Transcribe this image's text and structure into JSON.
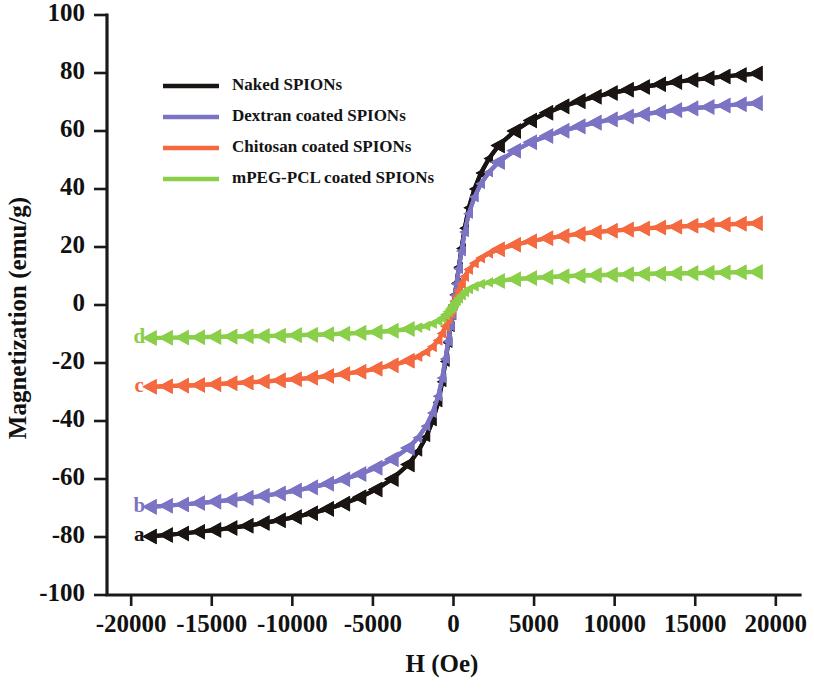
{
  "chart_data": {
    "type": "line",
    "title": "",
    "xlabel": "H (Oe)",
    "ylabel": "Magnetization (emu/g)",
    "xlim": [
      -21500,
      21500
    ],
    "ylim": [
      -100,
      100
    ],
    "xticks": [
      -20000,
      -15000,
      -10000,
      -5000,
      0,
      5000,
      10000,
      15000,
      20000
    ],
    "xticklabels": [
      "-20000",
      "-15000",
      "-10000",
      "-5000",
      "0",
      "5000",
      "10000",
      "15000",
      "20000"
    ],
    "yticks": [
      -100,
      -80,
      -60,
      -40,
      -20,
      0,
      20,
      40,
      60,
      80,
      100
    ],
    "yticklabels": [
      "-100",
      "-80",
      "-60",
      "-40",
      "-20",
      "0",
      "20",
      "40",
      "60",
      "80",
      "100"
    ],
    "grid": false,
    "marker": "left-triangle",
    "legend_position": "upper-left-inside",
    "x": [
      -18800,
      -17800,
      -16800,
      -15800,
      -14800,
      -13800,
      -12800,
      -11800,
      -10800,
      -9800,
      -8800,
      -7800,
      -6800,
      -5800,
      -4800,
      -3800,
      -2800,
      -2200,
      -1700,
      -1300,
      -950,
      -700,
      -500,
      -330,
      -190,
      -90,
      0,
      90,
      190,
      330,
      500,
      700,
      950,
      1300,
      1700,
      2200,
      2800,
      3800,
      4800,
      5800,
      6800,
      7800,
      8800,
      9800,
      10800,
      11800,
      12800,
      13800,
      14800,
      15800,
      16800,
      17800,
      18800
    ],
    "series": [
      {
        "name": "Naked SPIONs",
        "tag": "a",
        "color": "#1a1412",
        "saturation_positive": 79.5,
        "saturation_negative": -79.5,
        "values": [
          -79.8,
          -79.3,
          -78.8,
          -78.2,
          -77.6,
          -76.9,
          -76.1,
          -75.2,
          -74.2,
          -73.1,
          -71.8,
          -70.3,
          -68.5,
          -66.3,
          -63.6,
          -60.0,
          -55.0,
          -50.5,
          -45.5,
          -40.0,
          -33.5,
          -26.5,
          -19.5,
          -13.0,
          -7.5,
          -3.5,
          0.0,
          3.5,
          7.5,
          13.0,
          19.5,
          26.5,
          33.5,
          40.0,
          45.5,
          50.5,
          55.0,
          60.0,
          63.6,
          66.3,
          68.5,
          70.3,
          71.8,
          73.1,
          74.2,
          75.2,
          76.1,
          76.9,
          77.6,
          78.2,
          78.8,
          79.3,
          79.8
        ]
      },
      {
        "name": "Dextran coated SPIONs",
        "tag": "b",
        "color": "#7b74c4",
        "saturation_positive": 69.5,
        "saturation_negative": -69.5,
        "values": [
          -69.6,
          -69.2,
          -68.8,
          -68.3,
          -67.8,
          -67.2,
          -66.5,
          -65.8,
          -65.0,
          -64.0,
          -62.9,
          -61.6,
          -60.1,
          -58.3,
          -56.1,
          -53.2,
          -49.3,
          -45.8,
          -41.8,
          -37.2,
          -31.5,
          -25.2,
          -18.6,
          -12.5,
          -7.2,
          -3.4,
          0.0,
          3.4,
          7.2,
          12.5,
          18.6,
          25.2,
          31.5,
          37.2,
          41.8,
          45.8,
          49.3,
          53.2,
          56.1,
          58.3,
          60.1,
          61.6,
          62.9,
          64.0,
          65.0,
          65.8,
          66.5,
          67.2,
          67.8,
          68.3,
          68.8,
          69.2,
          69.6
        ]
      },
      {
        "name": "Chitosan coated SPIONs",
        "tag": "c",
        "color": "#f4693f",
        "saturation_positive": 28.0,
        "saturation_negative": -28.0,
        "values": [
          -28.2,
          -28.0,
          -27.8,
          -27.6,
          -27.3,
          -27.0,
          -26.7,
          -26.4,
          -26.0,
          -25.6,
          -25.1,
          -24.5,
          -23.8,
          -23.0,
          -22.0,
          -20.8,
          -19.2,
          -17.8,
          -16.2,
          -14.4,
          -12.2,
          -9.8,
          -7.3,
          -4.9,
          -2.9,
          -1.4,
          0.0,
          1.4,
          2.9,
          4.9,
          7.3,
          9.8,
          12.2,
          14.4,
          16.2,
          17.8,
          19.2,
          20.8,
          22.0,
          23.0,
          23.8,
          24.5,
          25.1,
          25.6,
          26.0,
          26.4,
          26.7,
          27.0,
          27.3,
          27.6,
          27.8,
          28.0,
          28.2
        ]
      },
      {
        "name": "mPEG-PCL coated SPIONs",
        "tag": "d",
        "color": "#8acf4a",
        "saturation_positive": 11.0,
        "saturation_negative": -11.0,
        "values": [
          -11.4,
          -11.3,
          -11.2,
          -11.1,
          -11.0,
          -10.9,
          -10.8,
          -10.7,
          -10.6,
          -10.4,
          -10.3,
          -10.1,
          -9.9,
          -9.6,
          -9.3,
          -8.9,
          -8.3,
          -7.8,
          -7.2,
          -6.4,
          -5.5,
          -4.5,
          -3.4,
          -2.3,
          -1.4,
          -0.7,
          0.0,
          0.7,
          1.4,
          2.3,
          3.4,
          4.5,
          5.5,
          6.4,
          7.2,
          7.8,
          8.3,
          8.9,
          9.3,
          9.6,
          9.9,
          10.1,
          10.3,
          10.4,
          10.6,
          10.7,
          10.8,
          10.9,
          11.0,
          11.1,
          11.2,
          11.3,
          11.4
        ]
      }
    ]
  },
  "legend": {
    "entries": [
      {
        "label": "Naked SPIONs",
        "color": "#1a1412"
      },
      {
        "label": "Dextran coated SPIONs",
        "color": "#7b74c4"
      },
      {
        "label": "Chitosan coated SPIONs",
        "color": "#f4693f"
      },
      {
        "label": "mPEG-PCL coated SPIONs",
        "color": "#8acf4a"
      }
    ]
  },
  "curve_tags": [
    {
      "text": "a",
      "color": "#1a1412"
    },
    {
      "text": "b",
      "color": "#7b74c4"
    },
    {
      "text": "c",
      "color": "#f4693f"
    },
    {
      "text": "d",
      "color": "#8acf4a"
    }
  ]
}
